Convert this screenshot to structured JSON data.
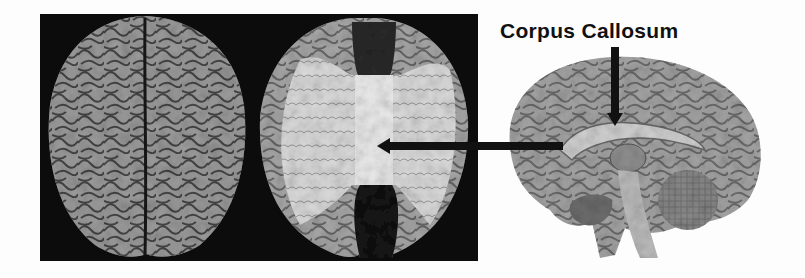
{
  "figure": {
    "label": "Corpus Callosum",
    "panels": [
      {
        "id": "brain-top-intact",
        "description": "Superior view of intact human brain showing gyri and sulci"
      },
      {
        "id": "brain-top-dissected",
        "description": "Superior view of dissected brain exposing corpus callosum fibers"
      },
      {
        "id": "brain-sagittal",
        "description": "Midsagittal section of human brain"
      }
    ],
    "arrows": [
      {
        "id": "arrow-horizontal",
        "from": [
          563,
          146
        ],
        "to": [
          377,
          146
        ]
      },
      {
        "id": "arrow-vertical",
        "from": [
          615,
          47
        ],
        "to": [
          615,
          125
        ]
      }
    ],
    "colors": {
      "background": "#fdfdfd",
      "panel": "#0c0c0c",
      "tissue": "#9a9a9a",
      "white_matter": "#e6e6e6",
      "arrow": "#111111"
    }
  }
}
